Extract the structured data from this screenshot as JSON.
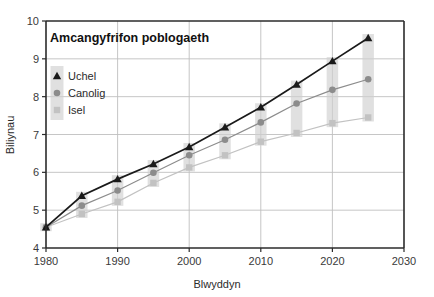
{
  "chart_data": {
    "type": "line",
    "title": "Amcangyfrifon poblogaeth",
    "xlabel": "Blwyddyn",
    "ylabel": "Biliynau",
    "xlim": [
      1980,
      2030
    ],
    "ylim": [
      4,
      10
    ],
    "xticks": [
      1980,
      1990,
      2000,
      2010,
      2020,
      2030
    ],
    "xtick_labels": [
      "1980",
      "1990",
      "2000",
      "2010",
      "2020",
      "2030"
    ],
    "yticks": [
      4,
      5,
      6,
      7,
      8,
      9,
      10
    ],
    "ytick_labels": [
      "4",
      "5",
      "6",
      "7",
      "8",
      "9",
      "10"
    ],
    "grid": true,
    "grid_axis": "y",
    "legend_position": "upper-left",
    "x": [
      1980,
      1985,
      1990,
      1995,
      2000,
      2005,
      2010,
      2015,
      2020,
      2025
    ],
    "series": [
      {
        "name": "Uchel",
        "marker": "triangle",
        "color": "#1a1a1a",
        "values": [
          4.55,
          5.38,
          5.82,
          6.22,
          6.67,
          7.19,
          7.72,
          8.32,
          8.94,
          9.55
        ]
      },
      {
        "name": "Canolig",
        "marker": "circle",
        "color": "#8c8c8c",
        "values": [
          4.55,
          5.12,
          5.52,
          5.99,
          6.45,
          6.86,
          7.32,
          7.82,
          8.18,
          8.46
        ]
      },
      {
        "name": "Isel",
        "marker": "square",
        "color": "#c2c2c2",
        "values": [
          4.55,
          4.9,
          5.22,
          5.72,
          6.13,
          6.45,
          6.81,
          7.04,
          7.3,
          7.45
        ]
      }
    ],
    "uncertainty_bands": {
      "description": "Shaded box at each year spanning Isel to Uchel",
      "color": "#cfcfcf",
      "opacity": 0.65,
      "width_years": 1.6
    }
  },
  "legend": {
    "items": [
      {
        "label": "Uchel",
        "marker": "triangle"
      },
      {
        "label": "Canolig",
        "marker": "circle"
      },
      {
        "label": "Isel",
        "marker": "square"
      }
    ]
  },
  "colors": {
    "high": "#1a1a1a",
    "medium": "#8c8c8c",
    "low": "#c2c2c2",
    "band": "#cfcfcf",
    "axis": "#2b2b2b",
    "grid": "#bfbfbf",
    "background": "#ffffff"
  }
}
